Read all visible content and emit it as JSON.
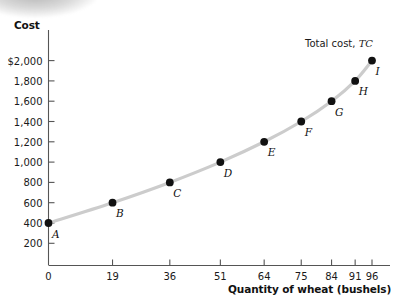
{
  "chart_data": {
    "type": "line",
    "title": "",
    "xlabel": "Quantity of wheat (bushels)",
    "ylabel": "Cost",
    "xlim": [
      0,
      101
    ],
    "ylim": [
      0,
      2100
    ],
    "grid": false,
    "legend_position": "inline-right",
    "series_label": "Total cost, TC",
    "series_label_plain": "Total cost,",
    "series_label_italic": "TC",
    "x_ticks": [
      "0",
      "19",
      "36",
      "51",
      "64",
      "75",
      "84",
      "91",
      "96"
    ],
    "x_tick_values": [
      0,
      19,
      36,
      51,
      64,
      75,
      84,
      91,
      96
    ],
    "y_ticks": [
      "$2,000",
      "1,800",
      "1,600",
      "1,400",
      "1,200",
      "1,000",
      "800",
      "600",
      "400",
      "200"
    ],
    "y_tick_values": [
      2000,
      1800,
      1600,
      1400,
      1200,
      1000,
      800,
      600,
      400,
      200
    ],
    "point_labels": [
      "A",
      "B",
      "C",
      "D",
      "E",
      "F",
      "G",
      "H",
      "I"
    ],
    "x": [
      0,
      19,
      36,
      51,
      64,
      75,
      84,
      91,
      96
    ],
    "values": [
      400,
      600,
      800,
      1000,
      1200,
      1400,
      1600,
      1800,
      2000
    ],
    "series": [
      {
        "name": "Total cost, TC",
        "x": [
          0,
          19,
          36,
          51,
          64,
          75,
          84,
          91,
          96
        ],
        "values": [
          400,
          600,
          800,
          1000,
          1200,
          1400,
          1600,
          1800,
          2000
        ],
        "point_labels": [
          "A",
          "B",
          "C",
          "D",
          "E",
          "F",
          "G",
          "H",
          "I"
        ],
        "line_color": "#cccccc",
        "point_color": "#111111"
      }
    ],
    "axis_color": "#555555"
  }
}
